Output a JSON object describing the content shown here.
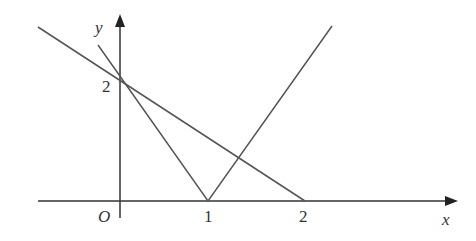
{
  "diagram": {
    "axes": {
      "x_label": "x",
      "y_label": "y",
      "origin_label": "O",
      "x_ticks": [
        "1",
        "2"
      ],
      "y_ticks": [
        "2"
      ]
    },
    "lines": [
      {
        "name": "line-through-(0,2)-and-(2,0)",
        "points": [
          [
            -1,
            2.95
          ],
          [
            2,
            0
          ]
        ]
      },
      {
        "name": "v-shape-absolute-value",
        "vertex": [
          1,
          0
        ],
        "left_end": [
          -0.25,
          2.5
        ],
        "right_end": [
          1.4,
          2.9
        ]
      }
    ],
    "colors": {
      "line": "#555555",
      "axis": "#333333",
      "background": "#ffffff"
    }
  }
}
